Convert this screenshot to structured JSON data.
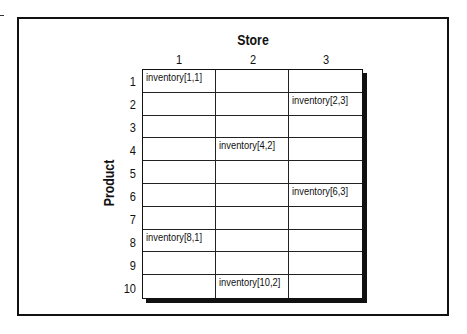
{
  "diagram": {
    "column_axis_title": "Store",
    "row_axis_title": "Product",
    "columns": [
      "1",
      "2",
      "3"
    ],
    "rows": [
      "1",
      "2",
      "3",
      "4",
      "5",
      "6",
      "7",
      "8",
      "9",
      "10"
    ],
    "cells": [
      [
        "inventory[1,1]",
        "",
        ""
      ],
      [
        "",
        "",
        "inventory[2,3]"
      ],
      [
        "",
        "",
        ""
      ],
      [
        "",
        "inventory[4,2]",
        ""
      ],
      [
        "",
        "",
        ""
      ],
      [
        "",
        "",
        "inventory[6,3]"
      ],
      [
        "",
        "",
        ""
      ],
      [
        "inventory[8,1]",
        "",
        ""
      ],
      [
        "",
        "",
        ""
      ],
      [
        "",
        "inventory[10,2]",
        ""
      ]
    ]
  }
}
